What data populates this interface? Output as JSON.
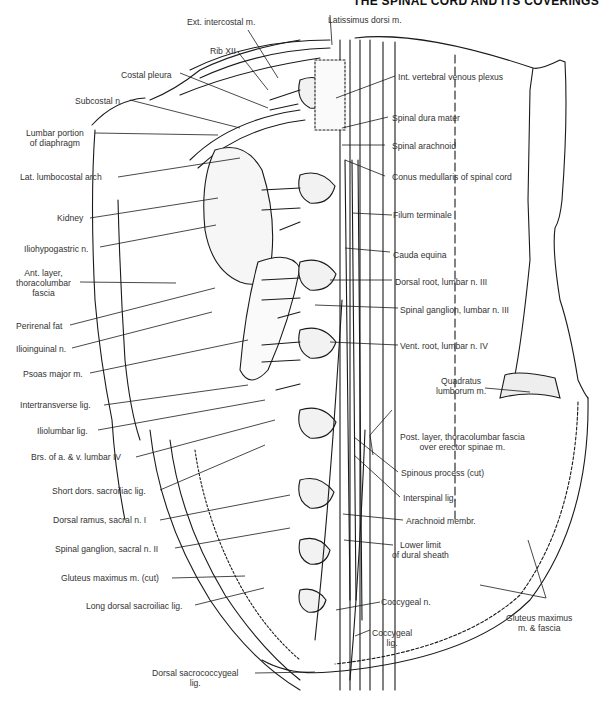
{
  "header": {
    "title": "THE SPINAL CORD AND ITS COVERINGS"
  },
  "figure": {
    "labels_left": [
      {
        "id": "ext-intercostal",
        "text": "Ext. intercostal m."
      },
      {
        "id": "rib-xii",
        "text": "Rib XII"
      },
      {
        "id": "costal-pleura",
        "text": "Costal pleura"
      },
      {
        "id": "subcostal-n",
        "text": "Subcostal n."
      },
      {
        "id": "lumbar-diaphragm",
        "text": "Lumbar portion of diaphragm",
        "lines": [
          "Lumbar portion",
          "of diaphragm"
        ]
      },
      {
        "id": "lat-lumbocostal-arch",
        "text": "Lat. lumbocostal arch"
      },
      {
        "id": "kidney",
        "text": "Kidney"
      },
      {
        "id": "iliohypogastric-n",
        "text": "Iliohypogastric n."
      },
      {
        "id": "ant-layer-tlf",
        "text": "Ant. layer, thoracolumbar fascia",
        "lines": [
          "Ant. layer,",
          "thoracolumbar",
          "fascia"
        ]
      },
      {
        "id": "perirenal-fat",
        "text": "Perirenal fat"
      },
      {
        "id": "ilioinguinal-n",
        "text": "Ilioinguinal n."
      },
      {
        "id": "psoas-major",
        "text": "Psoas major m."
      },
      {
        "id": "intertransverse-lig",
        "text": "Intertransverse lig."
      },
      {
        "id": "iliolumbar-lig",
        "text": "Iliolumbar lig."
      },
      {
        "id": "brs-lumbar-iv",
        "text": "Brs. of a. & v. lumbar IV"
      },
      {
        "id": "short-dors-sacroiliac",
        "text": "Short dors. sacroiliac lig."
      },
      {
        "id": "dorsal-ramus-s1",
        "text": "Dorsal ramus, sacral n. I"
      },
      {
        "id": "spinal-ganglion-s2",
        "text": "Spinal ganglion, sacral n. II"
      },
      {
        "id": "gluteus-max-cut",
        "text": "Gluteus maximus m. (cut)"
      },
      {
        "id": "long-dorsal-sacroiliac",
        "text": "Long dorsal sacroiliac lig."
      },
      {
        "id": "dorsal-sacrococcygeal",
        "text": "Dorsal sacrococcygeal lig.",
        "lines": [
          "Dorsal sacrococcygeal",
          "lig."
        ]
      }
    ],
    "labels_right": [
      {
        "id": "latissimus-dorsi",
        "text": "Latissimus dorsi m."
      },
      {
        "id": "int-vertebral-venous-plexus",
        "text": "Int. vertebral venous plexus"
      },
      {
        "id": "spinal-dura-mater",
        "text": "Spinal dura mater"
      },
      {
        "id": "spinal-arachnoid",
        "text": "Spinal arachnoid"
      },
      {
        "id": "conus-medullaris",
        "text": "Conus medullaris of spinal cord"
      },
      {
        "id": "filum-terminale",
        "text": "Filum terminale"
      },
      {
        "id": "cauda-equina",
        "text": "Cauda equina"
      },
      {
        "id": "dorsal-root-l3",
        "text": "Dorsal root, lumbar n. III"
      },
      {
        "id": "spinal-ganglion-l3",
        "text": "Spinal ganglion, lumbar n. III"
      },
      {
        "id": "vent-root-l4",
        "text": "Vent. root, lumbar n. IV"
      },
      {
        "id": "quadratus-lumborum",
        "text": "Quadratus lumborum m.",
        "lines": [
          "Quadratus",
          "lumborum m."
        ]
      },
      {
        "id": "post-layer-tlf",
        "text": "Post. layer, thoracolumbar fascia over erector spinae m.",
        "lines": [
          "Post. layer, thoracolumbar fascia",
          "over erector spinae m."
        ]
      },
      {
        "id": "spinous-process",
        "text": "Spinous process (cut)"
      },
      {
        "id": "interspinal-lig",
        "text": "Interspinal lig."
      },
      {
        "id": "arachnoid-membr",
        "text": "Arachnoid membr."
      },
      {
        "id": "lower-limit-dural",
        "text": "Lower limit of dural sheath",
        "lines": [
          "Lower limit",
          "of dural sheath"
        ]
      },
      {
        "id": "coccygeal-n",
        "text": "Coccygeal n."
      },
      {
        "id": "coccygeal-lig",
        "text": "Coccygeal lig.",
        "lines": [
          "Coccygeal",
          "lig."
        ]
      },
      {
        "id": "gluteus-max-fascia",
        "text": "Gluteus maximus m. & fascia",
        "lines": [
          "Gluteus maximus",
          "m. & fascia"
        ]
      }
    ]
  },
  "colors": {
    "ink": "#1a1a1a",
    "label": "#333333",
    "background": "#ffffff"
  }
}
